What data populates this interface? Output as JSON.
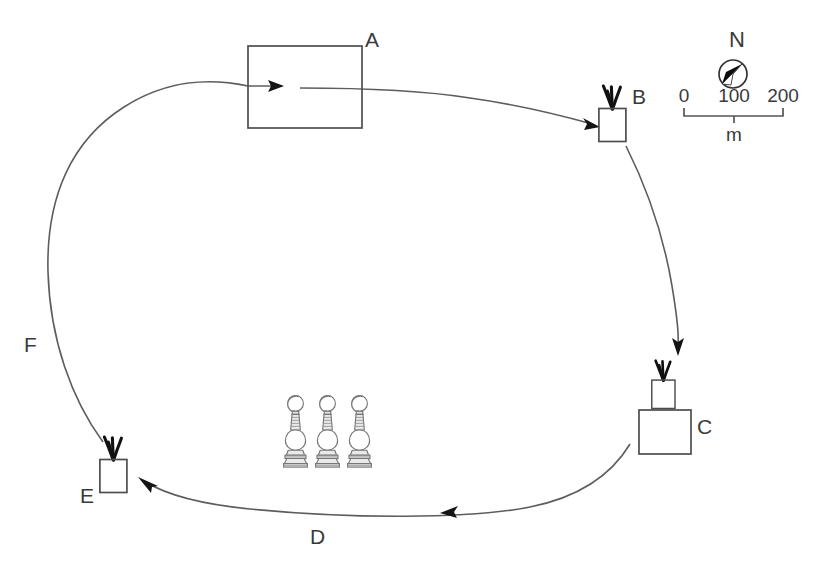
{
  "figure": {
    "type": "site-route-map",
    "background_color": "#ffffff",
    "line_color": "#5d5d5d",
    "label_color": "#3a3a3a"
  },
  "nodes": [
    {
      "id": "A",
      "label": "A",
      "icon": "large-building-rectangle",
      "label_x": 372,
      "label_y": 47
    },
    {
      "id": "B",
      "label": "B",
      "icon": "planted-pot",
      "label_x": 634,
      "label_y": 104
    },
    {
      "id": "C",
      "label": "C",
      "icon": "building-with-planted-pot",
      "label_x": 690,
      "label_y": 434
    },
    {
      "id": "E",
      "label": "E",
      "icon": "planted-pot",
      "label_x": 83,
      "label_y": 503
    }
  ],
  "paths": [
    {
      "id": "F",
      "label": "F",
      "label_x": 28,
      "label_y": 352,
      "direction": "from E up to A",
      "arrow_at": "A-entry"
    },
    {
      "id": "D",
      "label": "D",
      "label_x": 315,
      "label_y": 544,
      "direction": "from C left to E",
      "arrow_at": "E-entry"
    }
  ],
  "monuments": {
    "name": "stupa-finial-cluster",
    "count": 3,
    "positions_x": [
      296,
      328,
      360
    ],
    "base_y": 470
  },
  "compass": {
    "label": "N",
    "label_x": 745,
    "label_y": 46,
    "center_x": 733,
    "center_y": 74,
    "radius": 14,
    "needle_direction": "north-west"
  },
  "scalebar": {
    "unit_label": "m",
    "ticks": [
      "0",
      "100",
      "200"
    ],
    "tick_positions_x": [
      684,
      734,
      783
    ],
    "label_y": 102,
    "bar_y": 116,
    "unit_x": 734,
    "unit_y": 140
  }
}
